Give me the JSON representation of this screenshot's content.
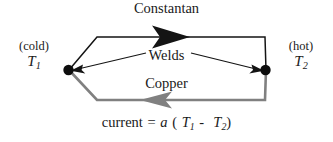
{
  "diagram": {
    "colors": {
      "constantan_wire": "#141414",
      "copper_wire": "#808080",
      "weld_dot": "#0d0d0d",
      "text": "#1a1a1a",
      "background": "#ffffff"
    },
    "labels": {
      "constantan": "Constantan",
      "welds": "Welds",
      "copper": "Copper"
    },
    "terminals": [
      {
        "id": "cold",
        "state_label": "(cold)",
        "symbol": "T",
        "subscript": "1",
        "position": "left"
      },
      {
        "id": "hot",
        "state_label": "(hot)",
        "symbol": "T",
        "subscript": "2",
        "position": "right"
      }
    ],
    "equation": {
      "lhs": "current",
      "equals": "=",
      "coefficient": "a",
      "open_paren": "(",
      "term1_symbol": "T",
      "term1_subscript": "1",
      "operator": "-",
      "term2_symbol": "T",
      "term2_subscript": "2",
      "close_paren": ")",
      "plain_text": "current = a ( T1 - T2)"
    },
    "arrows": [
      {
        "name": "constantan-current-arrow",
        "direction": "right",
        "color": "#141414"
      },
      {
        "name": "copper-current-arrow",
        "direction": "left",
        "color": "#808080"
      },
      {
        "name": "weld-leader-left",
        "direction": "left",
        "color": "#141414"
      },
      {
        "name": "weld-leader-right",
        "direction": "right",
        "color": "#141414"
      }
    ]
  }
}
